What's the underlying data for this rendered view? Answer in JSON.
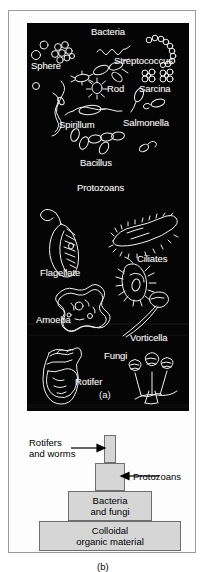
{
  "figure": {
    "panels": [
      {
        "id": "a",
        "letter": "(a)",
        "type": "micrograph-plate",
        "background_color": "#050505",
        "label_color": "#f2f2f2",
        "group_headings": [
          "Bacteria",
          "Protozoans",
          "Fungi"
        ],
        "organism_labels": [
          {
            "name": "Bacteria",
            "x": 64,
            "y": 4
          },
          {
            "name": "Sphere",
            "x": 4,
            "y": 38
          },
          {
            "name": "Streptococcus",
            "x": 87,
            "y": 33
          },
          {
            "name": "Rod",
            "x": 67,
            "y": 61
          },
          {
            "name": "Sarcina",
            "x": 112,
            "y": 61
          },
          {
            "name": "Spirillum",
            "x": 32,
            "y": 97
          },
          {
            "name": "Salmonella",
            "x": 96,
            "y": 95
          },
          {
            "name": "Bacillus",
            "x": 53,
            "y": 135
          },
          {
            "name": "Protozoans",
            "x": 50,
            "y": 160
          },
          {
            "name": "Flagellate",
            "x": 13,
            "y": 245
          },
          {
            "name": "Ciliates",
            "x": 108,
            "y": 231
          },
          {
            "name": "Amoeba",
            "x": 9,
            "y": 292
          },
          {
            "name": "Vorticella",
            "x": 103,
            "y": 310
          },
          {
            "name": "Fungi",
            "x": 77,
            "y": 328
          },
          {
            "name": "Rotifer",
            "x": 43,
            "y": 354
          }
        ]
      },
      {
        "id": "b",
        "letter": "(b)",
        "type": "pyramid-diagram",
        "fill_color": "#d6d6d6",
        "stroke_color": "#6e6e6e",
        "tiers": [
          {
            "id": "rotifers",
            "lines": []
          },
          {
            "id": "protozoans",
            "lines": []
          },
          {
            "id": "bacteria",
            "lines": [
              "Bacteria",
              "and fungi"
            ]
          },
          {
            "id": "colloidal",
            "lines": [
              "Colloidal",
              "organic material"
            ]
          }
        ],
        "callouts": [
          {
            "id": "rotifers",
            "lines": [
              "Rotifers",
              "and worms"
            ]
          },
          {
            "id": "protozoans",
            "lines": [
              "Protozoans"
            ]
          }
        ]
      }
    ]
  }
}
